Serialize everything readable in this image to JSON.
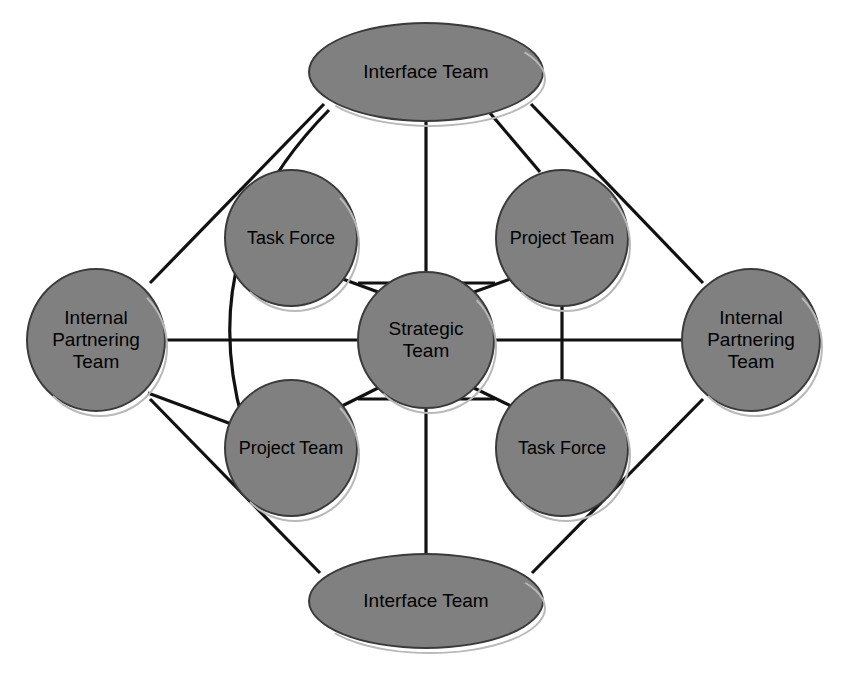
{
  "diagram": {
    "type": "node-link",
    "canvas": {
      "width": 852,
      "height": 691
    },
    "style": {
      "node_fill": "#808080",
      "node_stroke": "#3a3a3a",
      "node_shadow": "#b9b9b9",
      "edge_color": "#111111",
      "background": "#ffffff",
      "text_color": "#000000"
    },
    "nodes": [
      {
        "id": "interface-top",
        "label": "Interface Team",
        "shape": "ellipse",
        "cx": 426,
        "cy": 72,
        "rx": 118,
        "ry": 50
      },
      {
        "id": "interface-bottom",
        "label": "Interface Team",
        "shape": "ellipse",
        "cx": 426,
        "cy": 601,
        "rx": 118,
        "ry": 48
      },
      {
        "id": "internal-left",
        "label": "Internal Partnering Team",
        "shape": "circle",
        "cx": 96,
        "cy": 340,
        "rx": 70,
        "ry": 72
      },
      {
        "id": "internal-right",
        "label": "Internal Partnering Team",
        "shape": "circle",
        "cx": 751,
        "cy": 340,
        "rx": 70,
        "ry": 72
      },
      {
        "id": "task-force-top",
        "label": "Task Force",
        "shape": "circle",
        "cx": 291,
        "cy": 238,
        "rx": 67,
        "ry": 69
      },
      {
        "id": "project-team-top",
        "label": "Project Team",
        "shape": "circle",
        "cx": 562,
        "cy": 238,
        "rx": 67,
        "ry": 69
      },
      {
        "id": "strategic-team",
        "label": "Strategic Team",
        "shape": "circle",
        "cx": 426,
        "cy": 340,
        "rx": 69,
        "ry": 69
      },
      {
        "id": "project-team-bottom",
        "label": "Project Team",
        "shape": "circle",
        "cx": 291,
        "cy": 448,
        "rx": 67,
        "ry": 69
      },
      {
        "id": "task-force-bottom",
        "label": "Task Force",
        "shape": "circle",
        "cx": 562,
        "cy": 448,
        "rx": 67,
        "ry": 69
      }
    ],
    "edges": [
      {
        "from": "interface-top",
        "to": "internal-left",
        "kind": "line"
      },
      {
        "from": "interface-top",
        "to": "internal-right",
        "kind": "line"
      },
      {
        "from": "interface-bottom",
        "to": "internal-left",
        "kind": "line"
      },
      {
        "from": "interface-bottom",
        "to": "internal-right",
        "kind": "line"
      },
      {
        "from": "interface-top",
        "to": "project-team-bottom",
        "kind": "curve"
      },
      {
        "from": "interface-top",
        "to": "strategic-team",
        "kind": "line"
      },
      {
        "from": "interface-top",
        "to": "project-team-top",
        "kind": "line"
      },
      {
        "from": "interface-bottom",
        "to": "strategic-team",
        "kind": "line"
      },
      {
        "from": "internal-left",
        "to": "strategic-team",
        "kind": "line"
      },
      {
        "from": "internal-right",
        "to": "strategic-team",
        "kind": "line"
      },
      {
        "from": "internal-left",
        "to": "project-team-bottom",
        "kind": "line"
      },
      {
        "from": "task-force-top",
        "to": "project-team-top",
        "kind": "line"
      },
      {
        "from": "project-team-bottom",
        "to": "task-force-bottom",
        "kind": "line"
      },
      {
        "from": "project-team-top",
        "to": "task-force-bottom",
        "kind": "line"
      },
      {
        "from": "strategic-team",
        "to": "task-force-top",
        "kind": "line"
      },
      {
        "from": "strategic-team",
        "to": "project-team-top",
        "kind": "line"
      },
      {
        "from": "strategic-team",
        "to": "project-team-bottom",
        "kind": "line"
      },
      {
        "from": "strategic-team",
        "to": "task-force-bottom",
        "kind": "line"
      }
    ]
  }
}
